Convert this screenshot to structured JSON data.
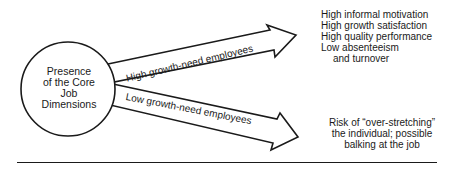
{
  "diagram": {
    "source": {
      "label_lines": [
        "Presence",
        "of the Core",
        "Job",
        "Dimensions"
      ]
    },
    "branches": [
      {
        "label": "High growth-need employees",
        "outcomes": [
          "High informal motivation",
          "High growth satisfaction",
          "High quality performance",
          "Low absenteeism",
          "and turnover"
        ]
      },
      {
        "label": "Low growth-need employees",
        "outcomes": [
          "Risk of “over-stretching”",
          "the individual; possible",
          "balking at the job"
        ]
      }
    ],
    "colors": {
      "ink": "#1a1a1a",
      "background": "#ffffff"
    }
  }
}
